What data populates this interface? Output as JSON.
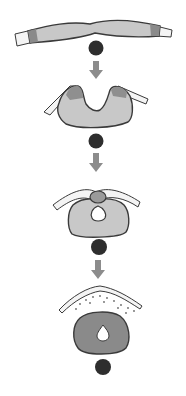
{
  "diagram": {
    "type": "sequential-stages",
    "stage_count": 4,
    "stages": [
      {
        "id": "stage-1",
        "description": "flat plate with dark dot below"
      },
      {
        "id": "stage-2",
        "description": "U-shaped fold with raised edges and dark dot below"
      },
      {
        "id": "stage-3",
        "description": "closing ring with small cap at top and dark dot below"
      },
      {
        "id": "stage-4",
        "description": "closed dark ring with teardrop lumen under curved layer and dark dot below"
      }
    ],
    "arrows": 3,
    "colors": {
      "tissue_light": "#c8c8c8",
      "tissue_mid": "#9a9a9a",
      "tissue_dark": "#7a7a7a",
      "outline": "#3a3a3a",
      "dot": "#2e2e2e",
      "arrow": "#8c8c8c",
      "layer": "#f2f2f2"
    }
  }
}
